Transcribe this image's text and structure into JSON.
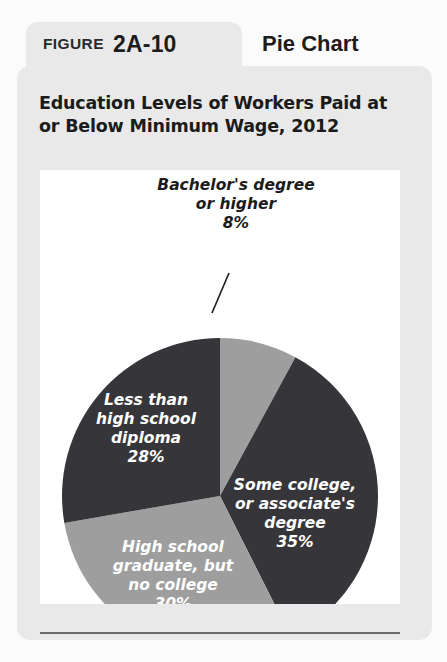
{
  "figure": {
    "label_word": "FIGURE",
    "number": "2A-10",
    "kind": "Pie Chart",
    "title": "Education Levels of Workers Paid at or Below Minimum Wage, 2012"
  },
  "colors": {
    "dark_slice": "#36363a",
    "light_slice": "#9e9e9e",
    "card_background": "#e9e9e9",
    "panel_background": "#ffffff",
    "rule": "#6a6a6a",
    "label_on_slice": "#ffffff",
    "label_callout": "#1b1b1b"
  },
  "chart_data": {
    "type": "pie",
    "title": "Education Levels of Workers Paid at or Below Minimum Wage, 2012",
    "categories": [
      "Bachelor's degree or higher",
      "Some college, or associate's degree",
      "High school graduate, but no college",
      "Less than high school diploma"
    ],
    "values": [
      8,
      35,
      30,
      28
    ],
    "value_labels": [
      "8%",
      "35%",
      "30%",
      "28%"
    ],
    "units": "percent",
    "start_angle_deg": 0,
    "direction": "clockwise",
    "legend": "none",
    "labels_inside": [
      false,
      true,
      true,
      true
    ],
    "slices": [
      {
        "name": "Bachelor's degree or higher",
        "value": 8,
        "value_label": "8%",
        "color": "#9e9e9e",
        "lines": [
          "Bachelor's degree",
          "or higher",
          "8%"
        ],
        "label_placement": "outside-top",
        "has_leader_line": true
      },
      {
        "name": "Some college, or associate's degree",
        "value": 35,
        "value_label": "35%",
        "color": "#36363a",
        "lines": [
          "Some college,",
          "or associate's",
          "degree",
          "35%"
        ],
        "label_placement": "inside",
        "has_leader_line": false
      },
      {
        "name": "High school graduate, but no college",
        "value": 30,
        "value_label": "30%",
        "color": "#9e9e9e",
        "lines": [
          "High school",
          "graduate, but",
          "no college",
          "30%"
        ],
        "label_placement": "inside",
        "has_leader_line": false
      },
      {
        "name": "Less than high school diploma",
        "value": 28,
        "value_label": "28%",
        "color": "#36363a",
        "lines": [
          "Less than",
          "high school",
          "diploma",
          "28%"
        ],
        "label_placement": "inside",
        "has_leader_line": false
      }
    ]
  }
}
